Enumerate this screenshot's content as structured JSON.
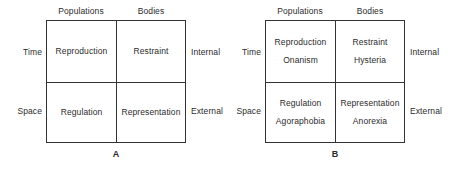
{
  "figure": {
    "background_color": "#ffffff",
    "line_color": "#333333",
    "text_color": "#2b2b2b",
    "diagrams": [
      {
        "caption": "A",
        "column_headers": [
          "Populations",
          "Bodies"
        ],
        "row_labels_left": [
          "Time",
          "Space"
        ],
        "row_labels_right": [
          "Internal",
          "External"
        ],
        "cells": [
          [
            {
              "primary": "Reproduction",
              "secondary": ""
            },
            {
              "primary": "Restraint",
              "secondary": ""
            }
          ],
          [
            {
              "primary": "Regulation",
              "secondary": ""
            },
            {
              "primary": "Representation",
              "secondary": ""
            }
          ]
        ]
      },
      {
        "caption": "B",
        "column_headers": [
          "Populations",
          "Bodies"
        ],
        "row_labels_left": [
          "Time",
          "Space"
        ],
        "row_labels_right": [
          "Internal",
          "External"
        ],
        "cells": [
          [
            {
              "primary": "Reproduction",
              "secondary": "Onanism"
            },
            {
              "primary": "Restraint",
              "secondary": "Hysteria"
            }
          ],
          [
            {
              "primary": "Regulation",
              "secondary": "Agoraphobia"
            },
            {
              "primary": "Representation",
              "secondary": "Anorexia"
            }
          ]
        ]
      }
    ]
  }
}
